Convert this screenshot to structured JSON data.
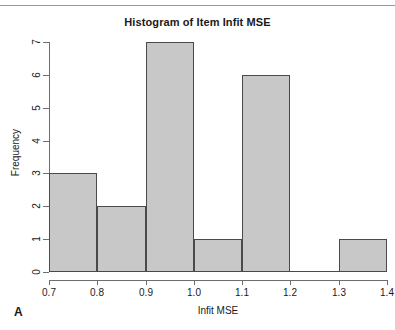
{
  "panel": {
    "label": "A"
  },
  "chart_data": {
    "type": "bar",
    "title": "Histogram of Item Infit MSE",
    "xlabel": "Infit MSE",
    "ylabel": "Frequency",
    "xlim": [
      0.7,
      1.4
    ],
    "ylim": [
      0,
      7
    ],
    "grid": false,
    "legend": null,
    "bin_width": 0.1,
    "bin_edges": [
      0.7,
      0.8,
      0.9,
      1.0,
      1.1,
      1.2,
      1.3,
      1.4
    ],
    "categories": [
      "0.7-0.8",
      "0.8-0.9",
      "0.9-1.0",
      "1.0-1.1",
      "1.1-1.2",
      "1.2-1.3",
      "1.3-1.4"
    ],
    "values": [
      3,
      2,
      7,
      1,
      6,
      0,
      1
    ],
    "x_tick_labels": [
      "0.7",
      "0.8",
      "0.9",
      "1.0",
      "1.1",
      "1.2",
      "1.3",
      "1.4"
    ],
    "x_tick_values": [
      0.7,
      0.8,
      0.9,
      1.0,
      1.1,
      1.2,
      1.3,
      1.4
    ],
    "y_tick_labels": [
      "0",
      "1",
      "2",
      "3",
      "4",
      "5",
      "6",
      "7"
    ],
    "y_tick_values": [
      0,
      1,
      2,
      3,
      4,
      5,
      6,
      7
    ],
    "total_count": 20,
    "colors": {
      "bar_fill": "#c8c8c8",
      "bar_border": "#4a4a4a",
      "axis": "#6e6e6e",
      "text": "#1a1a1a",
      "background": "#ffffff"
    }
  }
}
